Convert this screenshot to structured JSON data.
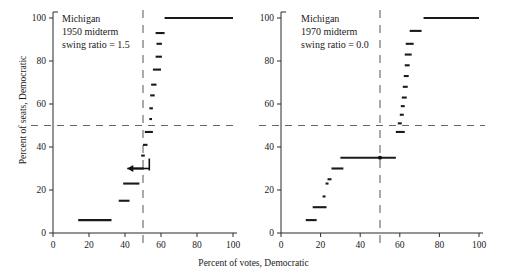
{
  "figure": {
    "xlabel": "Percent  of  votes, Democratic",
    "ylabel": "Percent of seats, Democratic"
  },
  "chart_data": [
    {
      "type": "line",
      "title": "Michigan",
      "subtitle": "1950 midterm",
      "annotation": "swing ratio = 1.5",
      "xlabel": "Percent  of  votes, Democratic",
      "ylabel": "Percent of seats, Democratic",
      "xlim": [
        0,
        100
      ],
      "ylim": [
        0,
        100
      ],
      "xticks": [
        0,
        20,
        40,
        60,
        80,
        100
      ],
      "yticks": [
        0,
        20,
        40,
        60,
        80,
        100
      ],
      "grid": false,
      "reference_lines": [
        {
          "orientation": "horizontal",
          "value": 50,
          "style": "dashed"
        },
        {
          "orientation": "vertical",
          "value": 50,
          "style": "dashed"
        }
      ],
      "marker_point": {
        "x": 48.5,
        "y": 30,
        "style": "left-arrow"
      },
      "steps": [
        {
          "x0": 14.0,
          "x1": 32.5,
          "y": 6
        },
        {
          "x0": 36.5,
          "x1": 42.5,
          "y": 15
        },
        {
          "x0": 39.0,
          "x1": 48.0,
          "y": 23
        },
        {
          "x0": 44.0,
          "x1": 50.5,
          "y": 30
        },
        {
          "x0": 49.0,
          "x1": 51.0,
          "y": 36
        },
        {
          "x0": 50.0,
          "x1": 52.5,
          "y": 41
        },
        {
          "x0": 51.0,
          "x1": 55.5,
          "y": 47
        },
        {
          "x0": 53.5,
          "x1": 55.0,
          "y": 53
        },
        {
          "x0": 53.5,
          "x1": 55.5,
          "y": 58
        },
        {
          "x0": 54.0,
          "x1": 56.5,
          "y": 64
        },
        {
          "x0": 54.5,
          "x1": 57.5,
          "y": 69
        },
        {
          "x0": 55.5,
          "x1": 60.0,
          "y": 76
        },
        {
          "x0": 57.0,
          "x1": 60.5,
          "y": 82
        },
        {
          "x0": 57.5,
          "x1": 60.5,
          "y": 88
        },
        {
          "x0": 57.0,
          "x1": 62.0,
          "y": 93
        },
        {
          "x0": 62.0,
          "x1": 100.0,
          "y": 100
        }
      ]
    },
    {
      "type": "line",
      "title": "Michigan",
      "subtitle": "1970 midterm",
      "annotation": "swing ratio = 0.0",
      "xlabel": "Percent  of  votes, Democratic",
      "ylabel": "Percent of seats, Democratic",
      "xlim": [
        0,
        100
      ],
      "ylim": [
        0,
        100
      ],
      "xticks": [
        0,
        20,
        40,
        60,
        80,
        100
      ],
      "yticks": [
        0,
        20,
        40,
        60,
        80,
        100
      ],
      "grid": false,
      "reference_lines": [
        {
          "orientation": "horizontal",
          "value": 50,
          "style": "dashed"
        },
        {
          "orientation": "vertical",
          "value": 50,
          "style": "dashed"
        }
      ],
      "marker_point": {
        "x": 50.0,
        "y": 35,
        "style": "dot"
      },
      "steps": [
        {
          "x0": 12.5,
          "x1": 18.0,
          "y": 6
        },
        {
          "x0": 16.0,
          "x1": 23.0,
          "y": 12
        },
        {
          "x0": 21.0,
          "x1": 22.5,
          "y": 17
        },
        {
          "x0": 22.5,
          "x1": 24.0,
          "y": 23
        },
        {
          "x0": 23.5,
          "x1": 25.5,
          "y": 25
        },
        {
          "x0": 25.5,
          "x1": 31.5,
          "y": 30
        },
        {
          "x0": 30.0,
          "x1": 58.0,
          "y": 35
        },
        {
          "x0": 58.0,
          "x1": 62.5,
          "y": 47
        },
        {
          "x0": 59.0,
          "x1": 61.0,
          "y": 51
        },
        {
          "x0": 60.0,
          "x1": 62.0,
          "y": 55
        },
        {
          "x0": 60.5,
          "x1": 62.5,
          "y": 59
        },
        {
          "x0": 61.0,
          "x1": 63.5,
          "y": 63
        },
        {
          "x0": 61.5,
          "x1": 64.0,
          "y": 68
        },
        {
          "x0": 62.0,
          "x1": 64.5,
          "y": 73
        },
        {
          "x0": 62.5,
          "x1": 65.0,
          "y": 78
        },
        {
          "x0": 62.5,
          "x1": 66.0,
          "y": 83
        },
        {
          "x0": 63.0,
          "x1": 67.0,
          "y": 88
        },
        {
          "x0": 65.0,
          "x1": 71.0,
          "y": 94
        },
        {
          "x0": 72.0,
          "x1": 100.0,
          "y": 100
        }
      ]
    }
  ]
}
